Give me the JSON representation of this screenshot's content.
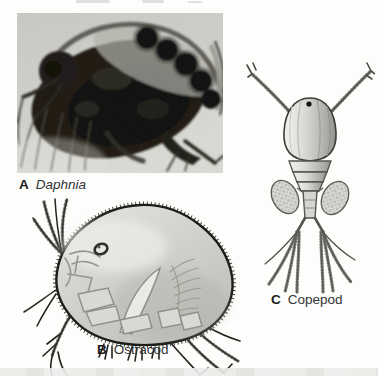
{
  "figure": {
    "panels": {
      "a": {
        "letter": "A",
        "name": "Daphnia"
      },
      "b": {
        "letter": "B",
        "name": "Ostracod"
      },
      "c": {
        "letter": "C",
        "name": "Copepod"
      }
    },
    "palette": {
      "page_background": "#fdfdfc",
      "photo_background": "#cfcfca",
      "photo_subject": "#15130d",
      "drawing_fill": "#d2d2cd",
      "drawing_ink": "#1c1c18",
      "label_text": "#2e2e2e"
    }
  }
}
